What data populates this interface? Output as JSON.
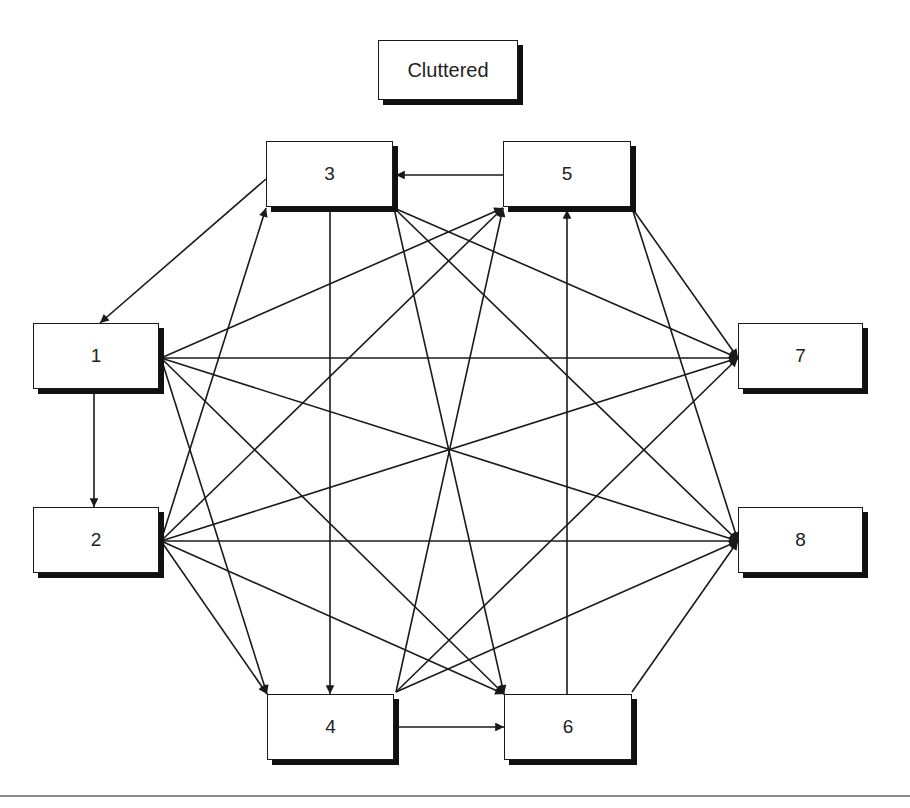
{
  "title": "Cluttered",
  "colors": {
    "line": "#1a1a1a",
    "shadow": "#111111",
    "background": "#ffffff",
    "rule": "#8a8a8a"
  },
  "nodes": [
    {
      "id": "title",
      "label": "Cluttered",
      "x": 378,
      "y": 40,
      "w": 140,
      "h": 60
    },
    {
      "id": "1",
      "label": "1",
      "x": 33,
      "y": 323,
      "w": 126,
      "h": 66
    },
    {
      "id": "2",
      "label": "2",
      "x": 33,
      "y": 507,
      "w": 126,
      "h": 66
    },
    {
      "id": "3",
      "label": "3",
      "x": 266,
      "y": 141,
      "w": 127,
      "h": 66
    },
    {
      "id": "4",
      "label": "4",
      "x": 267,
      "y": 694,
      "w": 127,
      "h": 66
    },
    {
      "id": "5",
      "label": "5",
      "x": 503,
      "y": 141,
      "w": 128,
      "h": 66
    },
    {
      "id": "6",
      "label": "6",
      "x": 504,
      "y": 694,
      "w": 128,
      "h": 66
    },
    {
      "id": "7",
      "label": "7",
      "x": 738,
      "y": 323,
      "w": 125,
      "h": 66
    },
    {
      "id": "8",
      "label": "8",
      "x": 738,
      "y": 507,
      "w": 125,
      "h": 66
    }
  ],
  "edges": [
    {
      "from": "5",
      "to": "3",
      "x1": 503,
      "y1": 175,
      "x2": 396,
      "y2": 175
    },
    {
      "from": "3",
      "to": "1",
      "x1": 266,
      "y1": 179,
      "x2": 100,
      "y2": 323
    },
    {
      "from": "1",
      "to": "2",
      "x1": 94,
      "y1": 389,
      "x2": 94,
      "y2": 507
    },
    {
      "from": "3",
      "to": "4",
      "x1": 330,
      "y1": 208,
      "x2": 330,
      "y2": 694
    },
    {
      "from": "4",
      "to": "6",
      "x1": 396,
      "y1": 727,
      "x2": 504,
      "y2": 727
    },
    {
      "from": "6",
      "to": "5",
      "x1": 567,
      "y1": 694,
      "x2": 567,
      "y2": 210
    },
    {
      "from": "1",
      "to": "5",
      "x1": 161,
      "y1": 358,
      "x2": 503,
      "y2": 208
    },
    {
      "from": "1",
      "to": "7",
      "x1": 161,
      "y1": 358,
      "x2": 738,
      "y2": 358
    },
    {
      "from": "1",
      "to": "8",
      "x1": 161,
      "y1": 358,
      "x2": 738,
      "y2": 541
    },
    {
      "from": "1",
      "to": "4",
      "x1": 161,
      "y1": 358,
      "x2": 267,
      "y2": 694
    },
    {
      "from": "1",
      "to": "6",
      "x1": 161,
      "y1": 358,
      "x2": 504,
      "y2": 694
    },
    {
      "from": "2",
      "to": "3",
      "x1": 161,
      "y1": 541,
      "x2": 266,
      "y2": 208
    },
    {
      "from": "2",
      "to": "5",
      "x1": 161,
      "y1": 541,
      "x2": 503,
      "y2": 208
    },
    {
      "from": "2",
      "to": "7",
      "x1": 161,
      "y1": 541,
      "x2": 738,
      "y2": 358
    },
    {
      "from": "2",
      "to": "8",
      "x1": 161,
      "y1": 541,
      "x2": 738,
      "y2": 541
    },
    {
      "from": "2",
      "to": "4",
      "x1": 161,
      "y1": 541,
      "x2": 267,
      "y2": 694
    },
    {
      "from": "2",
      "to": "6",
      "x1": 161,
      "y1": 541,
      "x2": 504,
      "y2": 694
    },
    {
      "from": "3",
      "to": "7",
      "x1": 394,
      "y1": 208,
      "x2": 738,
      "y2": 358
    },
    {
      "from": "3",
      "to": "8",
      "x1": 394,
      "y1": 208,
      "x2": 738,
      "y2": 541
    },
    {
      "from": "3",
      "to": "6",
      "x1": 394,
      "y1": 208,
      "x2": 504,
      "y2": 694
    },
    {
      "from": "4",
      "to": "5",
      "x1": 396,
      "y1": 692,
      "x2": 503,
      "y2": 208
    },
    {
      "from": "4",
      "to": "7",
      "x1": 396,
      "y1": 692,
      "x2": 738,
      "y2": 358
    },
    {
      "from": "4",
      "to": "8",
      "x1": 396,
      "y1": 692,
      "x2": 738,
      "y2": 541
    },
    {
      "from": "5",
      "to": "7",
      "x1": 632,
      "y1": 208,
      "x2": 738,
      "y2": 358
    },
    {
      "from": "5",
      "to": "8",
      "x1": 632,
      "y1": 208,
      "x2": 738,
      "y2": 541
    },
    {
      "from": "6",
      "to": "8",
      "x1": 632,
      "y1": 692,
      "x2": 738,
      "y2": 541
    }
  ]
}
